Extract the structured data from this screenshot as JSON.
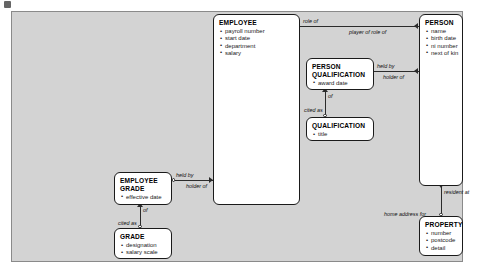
{
  "diagram": {
    "type": "entity-relationship-diagram",
    "background_color": "#d3d3d3",
    "entity_fill": "#ffffff",
    "line_color": "#2b2b2b",
    "entities": [
      {
        "id": "employee",
        "title": "EMPLOYEE",
        "attributes": [
          "payroll number",
          "start date",
          "department",
          "salary"
        ]
      },
      {
        "id": "person",
        "title": "PERSON",
        "attributes": [
          "name",
          "birth date",
          "ni number",
          "next of kin"
        ]
      },
      {
        "id": "person_qualification",
        "title": "PERSON QUALIFICATION",
        "title_line1": "PERSON",
        "title_line2": "QUALIFICATION",
        "attributes": [
          "award date"
        ]
      },
      {
        "id": "qualification",
        "title": "QUALIFICATION",
        "attributes": [
          "title"
        ]
      },
      {
        "id": "employee_grade",
        "title": "EMPLOYEE GRADE",
        "title_line1": "EMPLOYEE",
        "title_line2": "GRADE",
        "attributes": [
          "effective date"
        ]
      },
      {
        "id": "grade",
        "title": "GRADE",
        "attributes": [
          "designation",
          "salary scale"
        ]
      },
      {
        "id": "property",
        "title": "PROPERTY",
        "attributes": [
          "number",
          "postcode",
          "detail"
        ]
      }
    ],
    "relationship_labels": [
      {
        "id": "role_of",
        "text": "role of"
      },
      {
        "id": "player_of_role_of",
        "text": "player of role of"
      },
      {
        "id": "held_by_pq",
        "text": "held by"
      },
      {
        "id": "holder_of_pq",
        "text": "holder of"
      },
      {
        "id": "of_qual",
        "text": "of"
      },
      {
        "id": "cited_as_qual",
        "text": "cited as"
      },
      {
        "id": "held_by_grade",
        "text": "held by"
      },
      {
        "id": "holder_of_grade",
        "text": "holder of"
      },
      {
        "id": "of_grade",
        "text": "of"
      },
      {
        "id": "cited_as_grade",
        "text": "cited as"
      },
      {
        "id": "resident_at",
        "text": "resident at"
      },
      {
        "id": "home_address_for",
        "text": "home address for"
      }
    ]
  }
}
